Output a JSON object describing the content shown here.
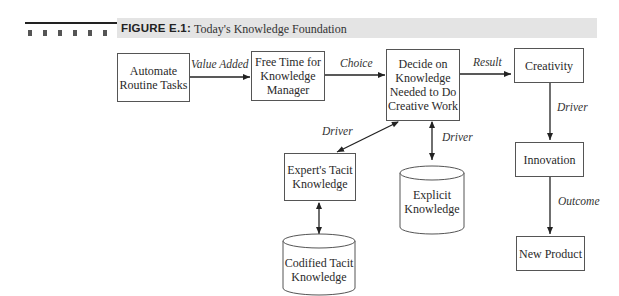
{
  "figure": {
    "label": "FIGURE E.1:",
    "title": "Today's Knowledge Foundation"
  },
  "nodes": {
    "automate": "Automate\nRoutine Tasks",
    "free_time": "Free Time for\nKnowledge\nManager",
    "decide": "Decide on\nKnowledge\nNeeded to Do\nCreative Work",
    "creativity": "Creativity",
    "innovation": "Innovation",
    "new_product": "New Product",
    "expert_tacit": "Expert's Tacit\nKnowledge",
    "explicit": "Explicit\nKnowledge",
    "codified_tacit": "Codified Tacit\nKnowledge"
  },
  "edges": {
    "value_added": "Value Added",
    "choice": "Choice",
    "result": "Result",
    "driver_creativity_innovation": "Driver",
    "outcome": "Outcome",
    "driver_expert": "Driver",
    "driver_explicit": "Driver"
  }
}
